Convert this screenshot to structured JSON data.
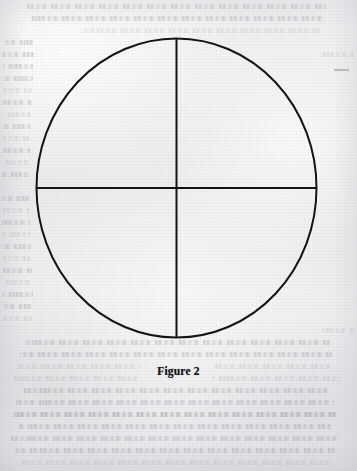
{
  "page": {
    "width": 357,
    "height": 471,
    "kind": "scanned-book-page",
    "paper_color": "#eeeef0",
    "ink_color": "#141416"
  },
  "figure": {
    "name": "circle-divided-into-quadrants",
    "shape": "ellipse",
    "center_x": 176.5,
    "center_y": 188,
    "radius_x": 140,
    "radius_y": 149.5,
    "stroke_color": "#141416",
    "stroke_width": 2,
    "fill": "none",
    "vertical_diameter": {
      "name": "vertical-diameter-line",
      "x": 176.5,
      "y_start": 38.5,
      "y_end": 337.5
    },
    "horizontal_diameter": {
      "name": "horizontal-diameter-line",
      "y": 188,
      "x_start": 36.5,
      "x_end": 316.5
    },
    "quadrant_count": 4
  },
  "caption": {
    "text": "Figure 2",
    "style": "bold",
    "align": "center",
    "top": 365
  },
  "artifacts": {
    "margin_dash": {
      "name": "margin-stray-dash",
      "left": 334,
      "top": 69,
      "width": 15
    },
    "bleed_through": {
      "label": "show-through text from reverse page",
      "line_spacing": 12,
      "lines": [
        {
          "top": 4,
          "left": 26,
          "width": 300,
          "tone": "mid"
        },
        {
          "top": 16,
          "left": 30,
          "width": 294,
          "tone": "mid"
        },
        {
          "top": 28,
          "left": 82,
          "width": 238,
          "tone": "faint"
        },
        {
          "top": 40,
          "left": 4,
          "width": 30,
          "tone": "mid"
        },
        {
          "top": 52,
          "left": 2,
          "width": 32,
          "tone": "mid"
        },
        {
          "top": 52,
          "left": 322,
          "width": 32,
          "tone": "faint"
        },
        {
          "top": 64,
          "left": 3,
          "width": 30,
          "tone": "mid"
        },
        {
          "top": 76,
          "left": 2,
          "width": 31,
          "tone": "mid"
        },
        {
          "top": 88,
          "left": 3,
          "width": 29,
          "tone": "faint"
        },
        {
          "top": 100,
          "left": 2,
          "width": 30,
          "tone": "mid"
        },
        {
          "top": 112,
          "left": 3,
          "width": 28,
          "tone": "faint"
        },
        {
          "top": 124,
          "left": 2,
          "width": 29,
          "tone": "mid"
        },
        {
          "top": 136,
          "left": 3,
          "width": 27,
          "tone": "faint"
        },
        {
          "top": 148,
          "left": 2,
          "width": 28,
          "tone": "mid"
        },
        {
          "top": 160,
          "left": 3,
          "width": 27,
          "tone": "faint"
        },
        {
          "top": 172,
          "left": 2,
          "width": 28,
          "tone": "mid"
        },
        {
          "top": 196,
          "left": 2,
          "width": 29,
          "tone": "mid"
        },
        {
          "top": 208,
          "left": 3,
          "width": 27,
          "tone": "faint"
        },
        {
          "top": 220,
          "left": 2,
          "width": 28,
          "tone": "mid"
        },
        {
          "top": 232,
          "left": 3,
          "width": 27,
          "tone": "faint"
        },
        {
          "top": 244,
          "left": 2,
          "width": 29,
          "tone": "mid"
        },
        {
          "top": 256,
          "left": 3,
          "width": 28,
          "tone": "faint"
        },
        {
          "top": 268,
          "left": 2,
          "width": 30,
          "tone": "mid"
        },
        {
          "top": 280,
          "left": 3,
          "width": 28,
          "tone": "faint"
        },
        {
          "top": 292,
          "left": 2,
          "width": 31,
          "tone": "mid"
        },
        {
          "top": 304,
          "left": 3,
          "width": 29,
          "tone": "mid"
        },
        {
          "top": 316,
          "left": 2,
          "width": 30,
          "tone": "faint"
        },
        {
          "top": 328,
          "left": 322,
          "width": 33,
          "tone": "faint"
        },
        {
          "top": 340,
          "left": 24,
          "width": 306,
          "tone": "mid"
        },
        {
          "top": 352,
          "left": 20,
          "width": 312,
          "tone": "mid"
        },
        {
          "top": 364,
          "left": 18,
          "width": 122,
          "tone": "faint"
        },
        {
          "top": 364,
          "left": 214,
          "width": 120,
          "tone": "faint"
        },
        {
          "top": 376,
          "left": 14,
          "width": 128,
          "tone": "faint"
        },
        {
          "top": 376,
          "left": 212,
          "width": 128,
          "tone": "faint"
        },
        {
          "top": 388,
          "left": 22,
          "width": 308,
          "tone": "mid"
        },
        {
          "top": 400,
          "left": 16,
          "width": 318,
          "tone": "mid"
        },
        {
          "top": 412,
          "left": 12,
          "width": 324,
          "tone": "dark"
        },
        {
          "top": 424,
          "left": 18,
          "width": 314,
          "tone": "mid"
        },
        {
          "top": 436,
          "left": 10,
          "width": 330,
          "tone": "mid"
        },
        {
          "top": 448,
          "left": 14,
          "width": 322,
          "tone": "mid"
        },
        {
          "top": 460,
          "left": 20,
          "width": 312,
          "tone": "faint"
        }
      ]
    }
  }
}
